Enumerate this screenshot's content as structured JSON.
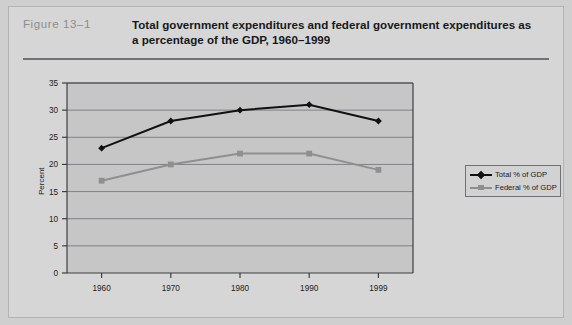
{
  "figure": {
    "number_label": "Figure  13–1",
    "title": "Total government expenditures and federal government expenditures as a percentage of the GDP, 1960–1999"
  },
  "colors": {
    "page_background": "#cfcfcf",
    "card_background": "#d6d6d6",
    "plot_background": "#c6c6c6",
    "rule": "#6f7277",
    "total_series": "#111111",
    "federal_series": "#8f8f8f",
    "figure_number_text": "#8d8d8d",
    "title_text": "#15181c"
  },
  "legend": {
    "position": "right-outside",
    "entries": [
      {
        "label": "Total % of GDP",
        "marker": "diamond",
        "color": "#111111"
      },
      {
        "label": "Federal % of GDP",
        "marker": "square",
        "color": "#8f8f8f"
      }
    ]
  },
  "chart_data": {
    "type": "line",
    "title": "Total government expenditures and federal government expenditures as a percentage of the GDP, 1960–1999",
    "xlabel": "",
    "ylabel": "Percent",
    "categories": [
      "1960",
      "1970",
      "1980",
      "1990",
      "1999"
    ],
    "series": [
      {
        "name": "Total % of GDP",
        "values": [
          23,
          28,
          30,
          31,
          28
        ],
        "color": "#111111",
        "marker": "diamond"
      },
      {
        "name": "Federal % of GDP",
        "values": [
          17,
          20,
          22,
          22,
          19
        ],
        "color": "#8f8f8f",
        "marker": "square"
      }
    ],
    "ylim": [
      0,
      35
    ],
    "ytick_values": [
      0,
      5,
      10,
      15,
      20,
      25,
      30,
      35
    ],
    "ytick_labels": [
      "0",
      "5",
      "10",
      "15",
      "20",
      "25",
      "30",
      "35"
    ],
    "xtick_labels": [
      "1960",
      "1970",
      "1980",
      "1990",
      "1999"
    ],
    "grid": "horizontal",
    "legend_position": "right"
  }
}
